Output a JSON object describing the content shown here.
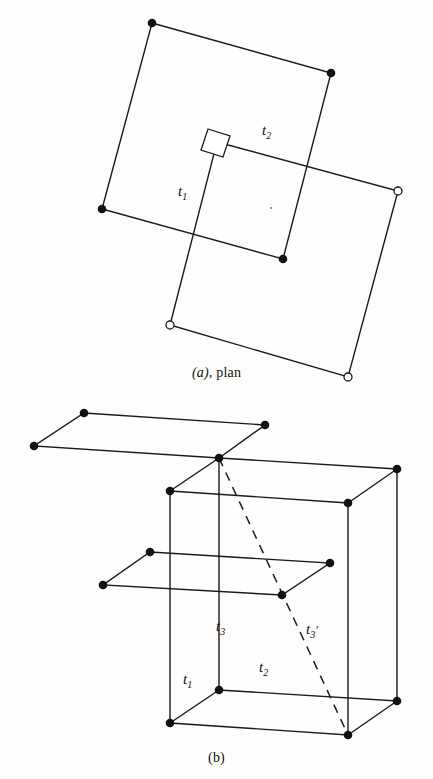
{
  "figure": {
    "title_a": "(a), plan",
    "title_a_italic": "(a)",
    "title_a_rest": ", plan",
    "title_b": "(b)",
    "stroke_color": "#1a1a1a",
    "node_fill_solid": "#111111",
    "node_fill_open": "#ffffff",
    "background": "#fdfdfc"
  },
  "panel_a": {
    "caption": "(a), plan",
    "caption_italic_part": "(a)",
    "caption_plain_part": ", plan",
    "labels": [
      {
        "name": "t1",
        "base": "t",
        "sub": "1",
        "x": 180,
        "y": 192
      },
      {
        "name": "t2",
        "base": "t",
        "sub": "2",
        "x": 264,
        "y": 131
      }
    ],
    "square_solid": {
      "name": "upper-square-solid-vertices",
      "points": "152,23 331,73 283,259 102,209",
      "vertices": [
        {
          "x": 152,
          "y": 23,
          "type": "solid"
        },
        {
          "x": 331,
          "y": 73,
          "type": "solid"
        },
        {
          "x": 283,
          "y": 259,
          "type": "solid"
        },
        {
          "x": 102,
          "y": 209,
          "type": "solid"
        }
      ]
    },
    "square_open": {
      "name": "lower-square-open-vertices",
      "points": "217,142 398,191 348,377 170,325",
      "vertices": [
        {
          "x": 217,
          "y": 142,
          "type": "solid"
        },
        {
          "x": 398,
          "y": 191,
          "type": "open"
        },
        {
          "x": 348,
          "y": 377,
          "type": "open"
        },
        {
          "x": 170,
          "y": 325,
          "type": "open"
        }
      ]
    },
    "small_square": {
      "name": "center-small-square",
      "points": "208,130 229,136 223,156 202,150"
    }
  },
  "panel_b": {
    "caption": "(b)",
    "labels": [
      {
        "name": "t1",
        "base": "t",
        "sub": "1",
        "prime": "",
        "x": 186,
        "y": 680
      },
      {
        "name": "t2",
        "base": "t",
        "sub": "2",
        "prime": "",
        "x": 262,
        "y": 668
      },
      {
        "name": "t3",
        "base": "t",
        "sub": "3",
        "prime": "",
        "x": 219,
        "y": 627
      },
      {
        "name": "t3prime",
        "base": "t",
        "sub": "3",
        "prime": "′",
        "x": 310,
        "y": 631
      }
    ],
    "box": {
      "name": "rectangular-prism",
      "front_top_left": {
        "x": 170,
        "y": 491
      },
      "front_top_right": {
        "x": 348,
        "y": 503
      },
      "front_bottom_left": {
        "x": 170,
        "y": 723
      },
      "front_bottom_right": {
        "x": 348,
        "y": 735
      },
      "back_top_left": {
        "x": 219,
        "y": 458
      },
      "back_top_right": {
        "x": 397,
        "y": 469
      },
      "back_bottom_left": {
        "x": 219,
        "y": 690
      },
      "back_bottom_right": {
        "x": 397,
        "y": 701
      }
    },
    "top_plane": {
      "name": "upper-horizontal-plane",
      "points": "84,413 265,425 219,458 34,446"
    },
    "mid_plane": {
      "name": "middle-horizontal-plane",
      "points": "150,552 330,563 282,595 103,585"
    },
    "diagonal": {
      "name": "dashed-diagonal",
      "from": {
        "x": 219,
        "y": 458
      },
      "to": {
        "x": 348,
        "y": 735
      },
      "style": "dashed"
    }
  }
}
